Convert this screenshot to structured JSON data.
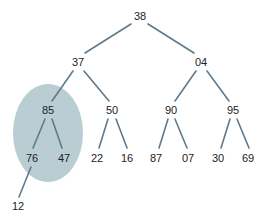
{
  "diagram": {
    "type": "binary-tree",
    "colors": {
      "edge": "#5e7a8c",
      "highlight": "#b9cdd3",
      "text": "#222222"
    },
    "highlight": {
      "subtree_root": "85",
      "cx": 48,
      "cy": 133,
      "rx": 35,
      "ry": 49
    },
    "nodes": [
      {
        "id": "n0",
        "label": "38",
        "x": 140,
        "y": 16
      },
      {
        "id": "n1",
        "label": "37",
        "x": 78,
        "y": 62
      },
      {
        "id": "n2",
        "label": "04",
        "x": 201,
        "y": 62
      },
      {
        "id": "n3",
        "label": "85",
        "x": 48,
        "y": 110
      },
      {
        "id": "n4",
        "label": "50",
        "x": 112,
        "y": 110
      },
      {
        "id": "n5",
        "label": "90",
        "x": 171,
        "y": 110
      },
      {
        "id": "n6",
        "label": "95",
        "x": 233,
        "y": 110
      },
      {
        "id": "n7",
        "label": "76",
        "x": 32,
        "y": 158
      },
      {
        "id": "n8",
        "label": "47",
        "x": 64,
        "y": 158
      },
      {
        "id": "n9",
        "label": "22",
        "x": 97,
        "y": 158
      },
      {
        "id": "n10",
        "label": "16",
        "x": 127,
        "y": 158
      },
      {
        "id": "n11",
        "label": "87",
        "x": 156,
        "y": 158
      },
      {
        "id": "n12",
        "label": "07",
        "x": 188,
        "y": 158
      },
      {
        "id": "n13",
        "label": "30",
        "x": 218,
        "y": 158
      },
      {
        "id": "n14",
        "label": "69",
        "x": 248,
        "y": 158
      },
      {
        "id": "n15",
        "label": "12",
        "x": 18,
        "y": 206
      }
    ],
    "edges": [
      {
        "from": "n0",
        "to": "n1",
        "x1": 131,
        "y1": 24,
        "x2": 85,
        "y2": 53
      },
      {
        "from": "n0",
        "to": "n2",
        "x1": 148,
        "y1": 24,
        "x2": 194,
        "y2": 53
      },
      {
        "from": "n1",
        "to": "n3",
        "x1": 73,
        "y1": 71,
        "x2": 52,
        "y2": 101
      },
      {
        "from": "n1",
        "to": "n4",
        "x1": 84,
        "y1": 71,
        "x2": 109,
        "y2": 101
      },
      {
        "from": "n2",
        "to": "n5",
        "x1": 196,
        "y1": 71,
        "x2": 175,
        "y2": 101
      },
      {
        "from": "n2",
        "to": "n6",
        "x1": 207,
        "y1": 71,
        "x2": 229,
        "y2": 101
      },
      {
        "from": "n3",
        "to": "n7",
        "x1": 45,
        "y1": 119,
        "x2": 33,
        "y2": 148
      },
      {
        "from": "n3",
        "to": "n8",
        "x1": 52,
        "y1": 119,
        "x2": 62,
        "y2": 148
      },
      {
        "from": "n4",
        "to": "n9",
        "x1": 108,
        "y1": 119,
        "x2": 99,
        "y2": 148
      },
      {
        "from": "n4",
        "to": "n10",
        "x1": 116,
        "y1": 119,
        "x2": 127,
        "y2": 148
      },
      {
        "from": "n5",
        "to": "n11",
        "x1": 168,
        "y1": 119,
        "x2": 159,
        "y2": 148
      },
      {
        "from": "n5",
        "to": "n12",
        "x1": 175,
        "y1": 119,
        "x2": 187,
        "y2": 148
      },
      {
        "from": "n6",
        "to": "n13",
        "x1": 230,
        "y1": 119,
        "x2": 221,
        "y2": 148
      },
      {
        "from": "n6",
        "to": "n14",
        "x1": 237,
        "y1": 119,
        "x2": 249,
        "y2": 148
      },
      {
        "from": "n7",
        "to": "n15",
        "x1": 31,
        "y1": 167,
        "x2": 19,
        "y2": 197
      }
    ]
  }
}
